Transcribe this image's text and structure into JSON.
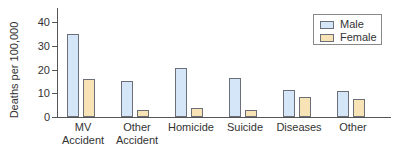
{
  "chart_data": {
    "type": "bar",
    "title": "",
    "xlabel": "",
    "ylabel": "Deaths per 100,000",
    "ylim": [
      0,
      45
    ],
    "yticks": [
      0,
      10,
      20,
      30,
      40
    ],
    "grid": false,
    "legend_position": "top-right",
    "categories": [
      "MV Accident",
      "Other Accident",
      "Homicide",
      "Suicide",
      "Diseases",
      "Other"
    ],
    "category_lines": [
      [
        "MV",
        "Accident"
      ],
      [
        "Other",
        "Accident"
      ],
      [
        "Homicide"
      ],
      [
        "Suicide"
      ],
      [
        "Diseases"
      ],
      [
        "Other"
      ]
    ],
    "series": [
      {
        "name": "Male",
        "color": "#d4e6f7",
        "values": [
          35,
          15,
          20.5,
          16.5,
          11.5,
          11
        ]
      },
      {
        "name": "Female",
        "color": "#f7e3b6",
        "values": [
          16,
          3,
          4,
          3,
          8.5,
          7.5
        ]
      }
    ]
  },
  "labels": {
    "ylabel": "Deaths per 100,000",
    "ticks": [
      "0",
      "10",
      "20",
      "30",
      "40"
    ],
    "legend": {
      "male": "Male",
      "female": "Female"
    },
    "categories": [
      {
        "line1": "MV",
        "line2": "Accident"
      },
      {
        "line1": "Other",
        "line2": "Accident"
      },
      {
        "line1": "Homicide",
        "line2": ""
      },
      {
        "line1": "Suicide",
        "line2": ""
      },
      {
        "line1": "Diseases",
        "line2": ""
      },
      {
        "line1": "Other",
        "line2": ""
      }
    ]
  }
}
